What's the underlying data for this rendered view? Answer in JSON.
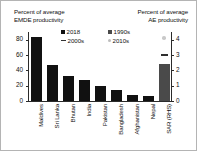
{
  "titles": {
    "left": "Percent of average\nEMDE productivity",
    "right": "Percent of average\nAE productivity"
  },
  "legend": {
    "items": [
      {
        "label": "2018",
        "marker": "square-black"
      },
      {
        "label": "1990s",
        "marker": "square-gray"
      },
      {
        "label": "2000s",
        "marker": "dash"
      },
      {
        "label": "2010s",
        "marker": "dot"
      }
    ]
  },
  "axes": {
    "left_ticks": [
      "80",
      "60",
      "40",
      "20",
      "0"
    ],
    "right_ticks": [
      "4",
      "3",
      "2",
      "1",
      "0"
    ]
  },
  "chart_data": {
    "type": "bar",
    "title": "Percent of average EMDE productivity",
    "subtitle": "Percent of average AE productivity",
    "xlabel": "",
    "ylabel": "Percent of average EMDE productivity",
    "ylabel_right": "Percent of average AE productivity",
    "ylim": [
      0,
      90
    ],
    "ylim_right": [
      0,
      4.5
    ],
    "grid": false,
    "legend_position": "top-center",
    "categories": [
      "Maldives",
      "Sri Lanka",
      "Bhutan",
      "India",
      "Pakistan",
      "Bangladesh",
      "Afghanistan",
      "Nepal",
      "SAR (RHS)"
    ],
    "series": [
      {
        "name": "2018",
        "axis": "left",
        "values": [
          83,
          47,
          32,
          27,
          20,
          15,
          8,
          7,
          null
        ]
      },
      {
        "name": "2018 (RHS)",
        "axis": "right",
        "values": [
          null,
          null,
          null,
          null,
          null,
          null,
          null,
          null,
          2.4
        ]
      }
    ],
    "overlay_markers": [
      {
        "name": "2000s",
        "category": "SAR (RHS)",
        "value": 3.0,
        "axis": "right",
        "marker": "dash"
      },
      {
        "name": "2010s",
        "category": "SAR (RHS)",
        "value": 4.1,
        "axis": "right",
        "marker": "dot"
      }
    ]
  }
}
